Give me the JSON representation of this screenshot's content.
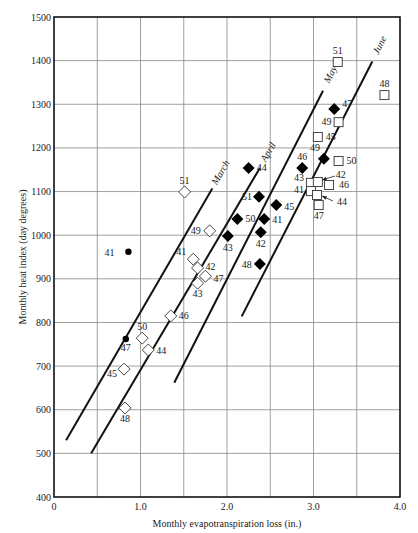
{
  "chart_data": {
    "type": "scatter",
    "title": "",
    "xlabel": "Monthly evapotranspiration loss (in.)",
    "ylabel": "Monthly heat index (day degrees)",
    "xlim": [
      0,
      4.0
    ],
    "ylim": [
      400,
      1500
    ],
    "x_ticks": [
      0,
      1.0,
      2.0,
      3.0,
      4.0
    ],
    "x_tick_labels": [
      "0",
      "1.0",
      "2.0",
      "3.0",
      "4.0"
    ],
    "y_ticks": [
      400,
      500,
      600,
      700,
      800,
      900,
      1000,
      1100,
      1200,
      1300,
      1400,
      1500
    ],
    "y_tick_labels": [
      "400",
      "500",
      "600",
      "700",
      "800",
      "900",
      "1000",
      "1100",
      "1200",
      "1300",
      "1400",
      "1500"
    ],
    "grid": true,
    "x_grid_step": 0.5,
    "y_grid_step": 100,
    "series": [
      {
        "name": "March",
        "marker": "filled-circle",
        "points": [
          {
            "label": "41",
            "x": 0.86,
            "y": 962
          },
          {
            "label": "47",
            "x": 0.83,
            "y": 762
          }
        ]
      },
      {
        "name": "April",
        "marker": "open-diamond",
        "points": [
          {
            "label": "51",
            "x": 1.51,
            "y": 1099
          },
          {
            "label": "49",
            "x": 1.8,
            "y": 1010
          },
          {
            "label": "41",
            "x": 1.61,
            "y": 945
          },
          {
            "label": "42",
            "x": 1.66,
            "y": 925
          },
          {
            "label": "47",
            "x": 1.75,
            "y": 906
          },
          {
            "label": "43",
            "x": 1.66,
            "y": 890
          },
          {
            "label": "46",
            "x": 1.35,
            "y": 815
          },
          {
            "label": "50",
            "x": 1.02,
            "y": 764
          },
          {
            "label": "44",
            "x": 1.09,
            "y": 737
          },
          {
            "label": "45",
            "x": 0.81,
            "y": 693
          },
          {
            "label": "48",
            "x": 0.82,
            "y": 604
          }
        ]
      },
      {
        "name": "May",
        "marker": "filled-diamond",
        "points": [
          {
            "label": "47",
            "x": 3.24,
            "y": 1289
          },
          {
            "label": "49",
            "x": 3.12,
            "y": 1175
          },
          {
            "label": "46",
            "x": 2.87,
            "y": 1154
          },
          {
            "label": "44",
            "x": 2.25,
            "y": 1154
          },
          {
            "label": "51",
            "x": 2.37,
            "y": 1088
          },
          {
            "label": "45",
            "x": 2.57,
            "y": 1069
          },
          {
            "label": "50",
            "x": 2.12,
            "y": 1037
          },
          {
            "label": "41",
            "x": 2.43,
            "y": 1037
          },
          {
            "label": "42",
            "x": 2.39,
            "y": 1007
          },
          {
            "label": "43",
            "x": 2.01,
            "y": 998
          },
          {
            "label": "48",
            "x": 2.38,
            "y": 934
          }
        ]
      },
      {
        "name": "June",
        "marker": "open-square",
        "points": [
          {
            "label": "51",
            "x": 3.28,
            "y": 1397
          },
          {
            "label": "48",
            "x": 3.82,
            "y": 1321
          },
          {
            "label": "49",
            "x": 3.29,
            "y": 1259
          },
          {
            "label": "45",
            "x": 3.05,
            "y": 1225
          },
          {
            "label": "50",
            "x": 3.29,
            "y": 1170
          },
          {
            "label": "43",
            "x": 2.97,
            "y": 1120
          },
          {
            "label": "42",
            "x": 3.05,
            "y": 1122
          },
          {
            "label": "46",
            "x": 3.18,
            "y": 1115
          },
          {
            "label": "41",
            "x": 2.97,
            "y": 1101
          },
          {
            "label": "44",
            "x": 3.04,
            "y": 1092
          },
          {
            "label": "47",
            "x": 3.06,
            "y": 1069
          }
        ]
      }
    ],
    "trend_lines": [
      {
        "name": "March",
        "label": "March",
        "from": [
          0.14,
          530
        ],
        "to": [
          1.83,
          1107
        ]
      },
      {
        "name": "April",
        "label": "April",
        "from": [
          0.43,
          500
        ],
        "to": [
          2.38,
          1154
        ]
      },
      {
        "name": "May",
        "label": "May",
        "from": [
          1.39,
          662
        ],
        "to": [
          3.11,
          1331
        ]
      },
      {
        "name": "June",
        "label": "June",
        "from": [
          2.17,
          814
        ],
        "to": [
          3.68,
          1398
        ]
      }
    ],
    "legend": null
  }
}
